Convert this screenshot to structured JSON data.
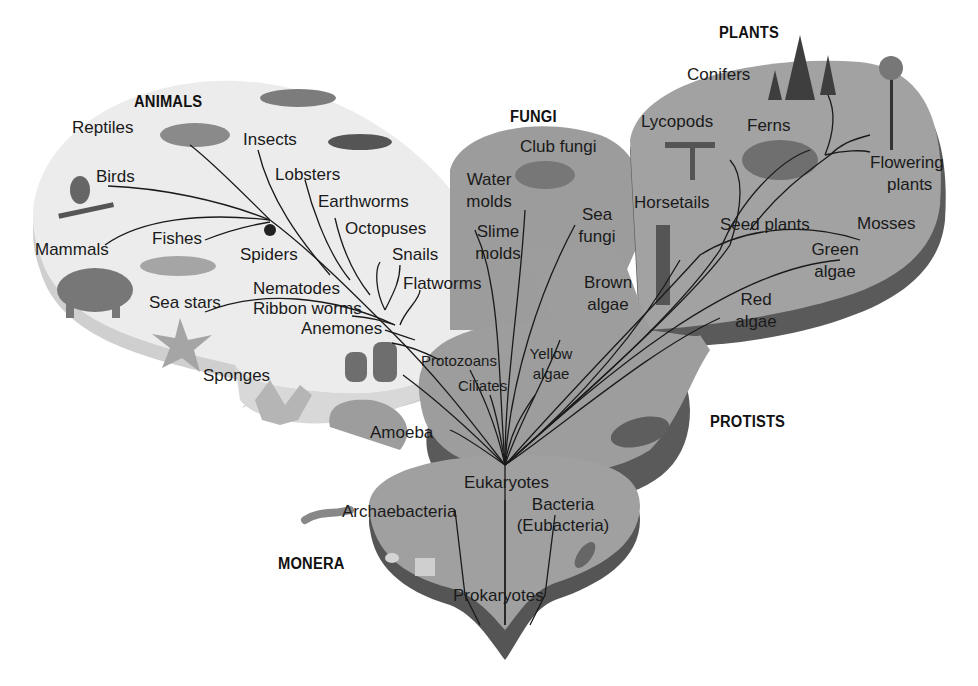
{
  "diagram": {
    "type": "phylogenetic-tree",
    "kingdoms": {
      "animals": "ANIMALS",
      "fungi": "FUNGI",
      "plants": "PLANTS",
      "protists": "PROTISTS",
      "monera": "MONERA"
    },
    "animals": {
      "reptiles": "Reptiles",
      "insects": "Insects",
      "birds": "Birds",
      "lobsters": "Lobsters",
      "earthworms": "Earthworms",
      "octopuses": "Octopuses",
      "mammals": "Mammals",
      "fishes": "Fishes",
      "spiders": "Spiders",
      "snails": "Snails",
      "flatworms": "Flatworms",
      "nematodes": "Nematodes",
      "sea_stars": "Sea stars",
      "ribbon_worms": "Ribbon worms",
      "anemones": "Anemones",
      "sponges": "Sponges"
    },
    "fungi": {
      "club_fungi": "Club fungi",
      "water_molds_1": "Water",
      "water_molds_2": "molds",
      "slime_molds_1": "Slime",
      "slime_molds_2": "molds",
      "sea_fungi_1": "Sea",
      "sea_fungi_2": "fungi"
    },
    "plants": {
      "conifers": "Conifers",
      "lycopods": "Lycopods",
      "ferns": "Ferns",
      "flowering_1": "Flowering",
      "flowering_2": "plants",
      "horsetails": "Horsetails",
      "seed_plants": "Seed plants",
      "mosses": "Mosses",
      "green_algae_1": "Green",
      "green_algae_2": "algae",
      "red_algae_1": "Red",
      "red_algae_2": "algae"
    },
    "protists": {
      "brown_algae_1": "Brown",
      "brown_algae_2": "algae",
      "protozoans": "Protozoans",
      "yellow_algae_1": "Yellow",
      "yellow_algae_2": "algae",
      "ciliates": "Ciliates",
      "amoeba": "Amoeba",
      "eukaryotes": "Eukaryotes"
    },
    "monera": {
      "archaebacteria": "Archaebacteria",
      "bacteria_1": "Bacteria",
      "bacteria_2": "(Eubacteria)",
      "prokaryotes": "Prokaryotes"
    },
    "colors": {
      "animals_fill": "#e6e6e6",
      "animals_edge": "#c8c8c8",
      "kingdom_fill": "#9a9a9a",
      "kingdom_edge": "#5e5e5e",
      "line": "#1a1a1a"
    }
  }
}
